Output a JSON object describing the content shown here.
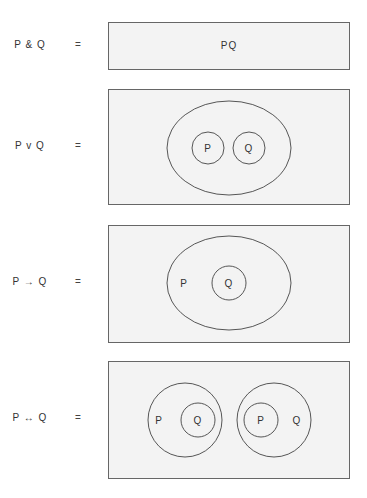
{
  "rows": [
    {
      "expression": "P & Q",
      "equals": "=",
      "content": "PQ"
    },
    {
      "expression": "P v Q",
      "equals": "=",
      "sets": {
        "outer": "",
        "inner": [
          "P",
          "Q"
        ]
      }
    },
    {
      "expression": "P → Q",
      "equals": "=",
      "sets": {
        "outer": "P",
        "inner": [
          "Q"
        ]
      }
    },
    {
      "expression": "P ↔ Q",
      "equals": "=",
      "groups": [
        {
          "outer": "P",
          "inner": "Q"
        },
        {
          "outer": "Q",
          "inner": "P"
        }
      ]
    }
  ],
  "colors": {
    "box_fill": "#f3f3f3",
    "stroke": "#444444"
  }
}
